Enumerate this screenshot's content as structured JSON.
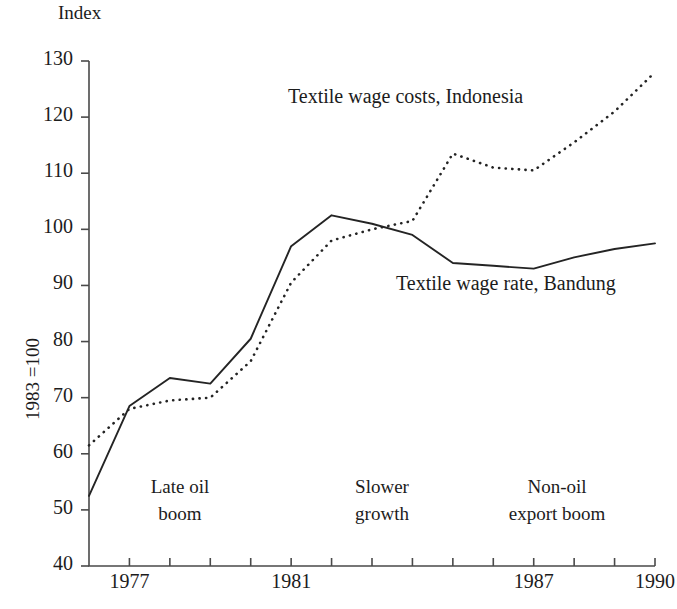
{
  "chart_data": {
    "type": "line",
    "title": "",
    "ylabel_top": "Index",
    "ylabel": "1983 =100",
    "xlabel": "",
    "xlim": [
      1976,
      1990
    ],
    "ylim": [
      40,
      130
    ],
    "grid": false,
    "legend_position": "inline-annotations",
    "y_ticks": [
      130,
      120,
      110,
      100,
      90,
      80,
      70,
      60,
      50,
      40
    ],
    "x_ticks": [
      1976,
      1977,
      1978,
      1979,
      1980,
      1981,
      1982,
      1983,
      1984,
      1985,
      1986,
      1987,
      1988,
      1989,
      1990
    ],
    "x_tick_labels": [
      "",
      "1977",
      "",
      "",
      "",
      "1981",
      "",
      "",
      "",
      "",
      "",
      "1987",
      "",
      "",
      "1990"
    ],
    "x": [
      1976,
      1977,
      1978,
      1979,
      1980,
      1981,
      1982,
      1983,
      1984,
      1985,
      1986,
      1987,
      1988,
      1989,
      1990
    ],
    "series": [
      {
        "name": "Textile wage costs, Indonesia",
        "style": "dotted",
        "color": "#242424",
        "values": [
          61.5,
          68.0,
          69.5,
          70.0,
          76.5,
          90.5,
          98.0,
          100.0,
          101.5,
          113.5,
          111.0,
          110.5,
          115.5,
          121.0,
          128.0
        ]
      },
      {
        "name": "Textile wage rate, Bandung",
        "style": "solid",
        "color": "#242424",
        "values": [
          52.5,
          68.5,
          73.5,
          72.5,
          80.5,
          97.0,
          102.5,
          101.0,
          99.0,
          94.0,
          93.5,
          93.0,
          95.0,
          96.5,
          97.5
        ]
      }
    ],
    "annotations": [
      {
        "text_line1": "Late oil",
        "text_line2": "boom",
        "x_center": 1978.4
      },
      {
        "text_line1": "Slower",
        "text_line2": "growth",
        "x_center": 1983.6
      },
      {
        "text_line1": "Non-oil",
        "text_line2": "export boom",
        "x_center": 1987.6
      }
    ],
    "series_labels": [
      {
        "text": "Textile wage costs, Indonesia",
        "x": 1983.0,
        "y": 121.5
      },
      {
        "text": "Textile wage rate, Bandung",
        "x": 1986.4,
        "y": 89.5
      }
    ]
  },
  "axes": {
    "y_title": "Index",
    "y_rot_title": "1983 =100",
    "y_tick_labels": [
      "130",
      "120",
      "110",
      "100",
      "90",
      "80",
      "70",
      "60",
      "50",
      "40"
    ],
    "x_tick_labels_visible": [
      "1977",
      "1981",
      "1987",
      "1990"
    ]
  },
  "labels": {
    "series_dotted": "Textile wage costs, Indonesia",
    "series_solid": "Textile wage rate, Bandung",
    "annot1_l1": "Late oil",
    "annot1_l2": "boom",
    "annot2_l1": "Slower",
    "annot2_l2": "growth",
    "annot3_l1": "Non-oil",
    "annot3_l2": "export boom"
  },
  "colors": {
    "line": "#242424",
    "axis": "#4a4a4a",
    "text": "#1c1c1c",
    "background": "#ffffff"
  }
}
